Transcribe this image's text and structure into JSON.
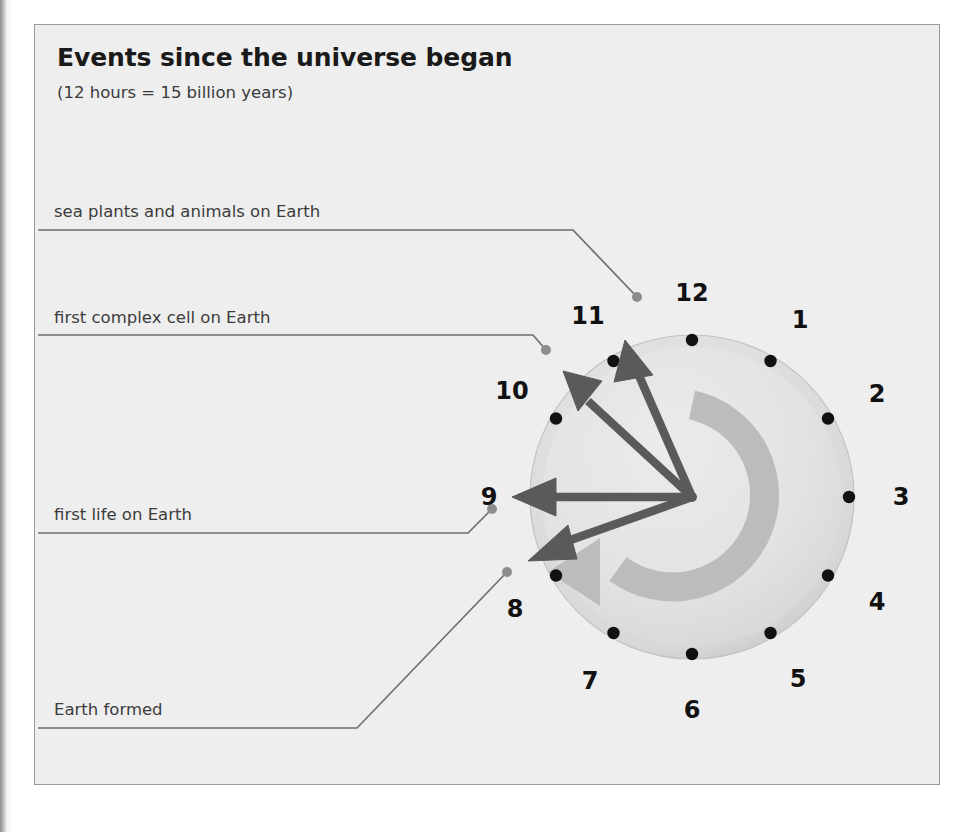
{
  "figure": {
    "title": "Events since the universe began",
    "subtitle": "(12 hours = 15 billion years)"
  },
  "colors": {
    "panel_background": "#eeeeee",
    "panel_border": "#9a9a9a",
    "title_text": "#1a1a1a",
    "label_text": "#3c3c3c",
    "leader_line": "#6e6e6e",
    "clock_face": "#e2e2e2",
    "clock_rim": "#cfcfcf",
    "clock_numeral": "#111111",
    "hour_dot": "#111111",
    "event_hand": "#5a5a5a",
    "direction_arrow": "#bcbcbc"
  },
  "clock": {
    "center_x": 692,
    "center_y": 497,
    "radius": 162,
    "numerals": [
      {
        "label": "12",
        "hour": 12,
        "x": 692,
        "y": 293
      },
      {
        "label": "1",
        "hour": 1,
        "x": 800,
        "y": 320
      },
      {
        "label": "2",
        "hour": 2,
        "x": 877,
        "y": 394
      },
      {
        "label": "3",
        "hour": 3,
        "x": 901,
        "y": 497
      },
      {
        "label": "4",
        "hour": 4,
        "x": 877,
        "y": 602
      },
      {
        "label": "5",
        "hour": 5,
        "x": 798,
        "y": 679
      },
      {
        "label": "6",
        "hour": 6,
        "x": 692,
        "y": 710
      },
      {
        "label": "7",
        "hour": 7,
        "x": 590,
        "y": 681
      },
      {
        "label": "8",
        "hour": 8,
        "x": 515,
        "y": 609
      },
      {
        "label": "9",
        "hour": 9,
        "x": 489,
        "y": 497
      },
      {
        "label": "10",
        "hour": 10,
        "x": 512,
        "y": 391
      },
      {
        "label": "11",
        "hour": 11,
        "x": 588,
        "y": 316
      }
    ],
    "direction_arrow": {
      "name": "counterclockwise-time-arrow",
      "band_radius": 92,
      "band_thickness": 29,
      "arrowhead_hour": 7
    }
  },
  "events": [
    {
      "id": "sea-plants-and-animals",
      "label": "sea plants and animals on Earth",
      "label_x": 54,
      "label_y": 202,
      "leader": {
        "x1": 38,
        "y1": 230,
        "x2": 573,
        "y2": 230,
        "x3": 637,
        "y3": 297
      },
      "dot": {
        "x": 637,
        "y": 297
      },
      "hand": {
        "tip_x": 625,
        "tip_y": 340,
        "clock_position": "11:45"
      }
    },
    {
      "id": "first-complex-cell",
      "label": "first complex cell on Earth",
      "label_x": 54,
      "label_y": 308,
      "leader": {
        "x1": 38,
        "y1": 335,
        "x2": 533,
        "y2": 335,
        "x3": 546,
        "y3": 350
      },
      "dot": {
        "x": 546,
        "y": 350
      },
      "hand": {
        "tip_x": 563,
        "tip_y": 371,
        "clock_position": "10:25"
      }
    },
    {
      "id": "first-life",
      "label": "first life on Earth",
      "label_x": 54,
      "label_y": 505,
      "leader": {
        "x1": 38,
        "y1": 533,
        "x2": 468,
        "y2": 533,
        "x3": 492,
        "y3": 509
      },
      "dot": {
        "x": 492,
        "y": 509
      },
      "hand": {
        "tip_x": 512,
        "tip_y": 497,
        "clock_position": "9:00"
      }
    },
    {
      "id": "earth-formed",
      "label": "Earth formed",
      "label_x": 54,
      "label_y": 700,
      "leader": {
        "x1": 38,
        "y1": 728,
        "x2": 357,
        "y2": 728,
        "x3": 507,
        "y3": 572
      },
      "dot": {
        "x": 507,
        "y": 572
      },
      "hand": {
        "tip_x": 528,
        "tip_y": 561,
        "clock_position": "8:20"
      }
    }
  ]
}
